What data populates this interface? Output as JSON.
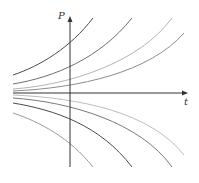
{
  "diagram": {
    "type": "solution-curves",
    "axes": {
      "y_label": "P",
      "x_label": "t",
      "origin": [
        70,
        93
      ],
      "y_axis": {
        "x": 70,
        "top": 16,
        "bottom": 167
      },
      "x_axis": {
        "y": 93,
        "left": 13,
        "right": 188
      },
      "color": "#333333"
    },
    "equilibrium": "P = 0",
    "curves": [
      {
        "name": "upper-1",
        "color": "#4a4a4a",
        "path": "M13,75 C40,66 70,48 93,18"
      },
      {
        "name": "upper-2",
        "color": "#6e6e6e",
        "path": "M13,84 C55,77 100,58 132,18"
      },
      {
        "name": "upper-3",
        "color": "#b4b4b4",
        "path": "M13,89 C70,85 140,62 172,18"
      },
      {
        "name": "upper-4",
        "color": "#8c8c8c",
        "path": "M13,91 C80,88 150,72 184,33"
      },
      {
        "name": "lower-1",
        "color": "#bdbdbd",
        "path": "M13,95 C80,98 150,112 184,155"
      },
      {
        "name": "lower-2",
        "color": "#7a7a7a",
        "path": "M13,98 C70,102 140,122 172,167"
      },
      {
        "name": "lower-3",
        "color": "#4a4a4a",
        "path": "M13,103 C55,110 100,125 132,167"
      },
      {
        "name": "lower-4",
        "color": "#9a9a9a",
        "path": "M13,113 C40,122 70,138 93,167"
      }
    ]
  }
}
